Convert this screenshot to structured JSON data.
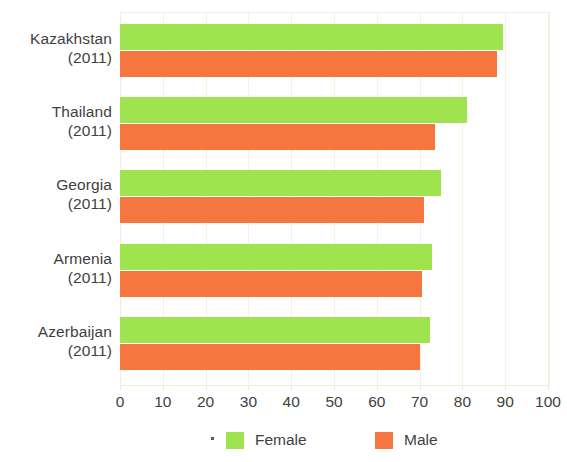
{
  "chart_data": {
    "type": "bar",
    "orientation": "horizontal",
    "title": "",
    "xlabel": "",
    "ylabel": "",
    "xlim": [
      0,
      100
    ],
    "xticks": [
      "0",
      "10",
      "20",
      "30",
      "40",
      "50",
      "60",
      "70",
      "80",
      "90",
      "100"
    ],
    "grid": true,
    "legend_position": "bottom",
    "categories": [
      {
        "name": "Kazakhstan",
        "year": "(2011)"
      },
      {
        "name": "Thailand",
        "year": "(2011)"
      },
      {
        "name": "Georgia",
        "year": "(2011)"
      },
      {
        "name": "Armenia",
        "year": "(2011)"
      },
      {
        "name": "Azerbaijan",
        "year": "(2011)"
      }
    ],
    "series": [
      {
        "name": "Female",
        "color": "#9fe44f",
        "values": [
          89.5,
          81,
          75,
          73,
          72.5
        ]
      },
      {
        "name": "Male",
        "color": "#f5773f",
        "values": [
          88,
          73.5,
          71,
          70.5,
          70
        ]
      }
    ]
  },
  "legend": {
    "items": [
      {
        "label": "Female",
        "color": "#9fe44f"
      },
      {
        "label": "Male",
        "color": "#f5773f"
      }
    ]
  },
  "colors": {
    "female": "#9fe44f",
    "male": "#f5773f",
    "gridline": "#f2f2de",
    "text": "#3f3f3f",
    "background": "#ffffff"
  }
}
